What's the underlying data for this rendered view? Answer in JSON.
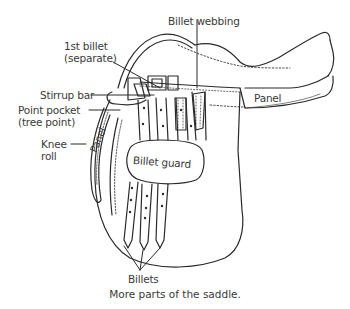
{
  "diagram": {
    "labels": {
      "first_billet_line1": "1st billet",
      "first_billet_line2": "(separate)",
      "billet_webbing": "Billet webbing",
      "stirrup_bar": "Stirrup bar",
      "point_pocket_line1": "Point pocket",
      "point_pocket_line2": "(tree point)",
      "knee_roll_line1": "Knee",
      "knee_roll_line2": "roll",
      "panel_right": "Panel",
      "panel_left": "Panel",
      "billet_guard": "Billet guard",
      "billets": "Billets"
    },
    "caption": "More parts of the saddle.",
    "colors": {
      "line": "#2a2a2a",
      "text": "#3a3a3a",
      "background": "#ffffff"
    }
  }
}
